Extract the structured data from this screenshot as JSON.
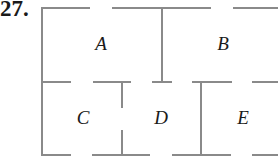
{
  "problem": {
    "number": "27."
  },
  "diagram": {
    "type": "floor-plan",
    "wall_color": "#8a8a8a",
    "label_color": "#1a1a1a",
    "rooms": [
      {
        "id": "A",
        "label": "A",
        "x": 101,
        "y": 46
      },
      {
        "id": "B",
        "label": "B",
        "x": 223,
        "y": 46
      },
      {
        "id": "C",
        "label": "C",
        "x": 83,
        "y": 120
      },
      {
        "id": "D",
        "label": "D",
        "x": 161,
        "y": 120
      },
      {
        "id": "E",
        "label": "E",
        "x": 243,
        "y": 120
      }
    ],
    "walls": [
      {
        "name": "top-wall-seg-1",
        "x1": 42,
        "y1": 8,
        "x2": 90,
        "y2": 8
      },
      {
        "name": "top-wall-seg-2",
        "x1": 112,
        "y1": 8,
        "x2": 211,
        "y2": 8
      },
      {
        "name": "top-wall-seg-3",
        "x1": 233,
        "y1": 8,
        "x2": 278,
        "y2": 8
      },
      {
        "name": "left-wall",
        "x1": 42,
        "y1": 7,
        "x2": 42,
        "y2": 156
      },
      {
        "name": "middle-wall-seg-1",
        "x1": 42,
        "y1": 82,
        "x2": 71,
        "y2": 82
      },
      {
        "name": "middle-wall-seg-2",
        "x1": 93,
        "y1": 82,
        "x2": 131,
        "y2": 82
      },
      {
        "name": "middle-wall-seg-3",
        "x1": 152,
        "y1": 82,
        "x2": 172,
        "y2": 82
      },
      {
        "name": "middle-wall-seg-4",
        "x1": 192,
        "y1": 82,
        "x2": 232,
        "y2": 82
      },
      {
        "name": "middle-wall-seg-5",
        "x1": 252,
        "y1": 82,
        "x2": 278,
        "y2": 82
      },
      {
        "name": "bottom-wall-seg-1",
        "x1": 42,
        "y1": 155,
        "x2": 71,
        "y2": 155
      },
      {
        "name": "bottom-wall-seg-2",
        "x1": 92,
        "y1": 155,
        "x2": 150,
        "y2": 155
      },
      {
        "name": "bottom-wall-seg-3",
        "x1": 172,
        "y1": 155,
        "x2": 231,
        "y2": 155
      },
      {
        "name": "bottom-wall-seg-4",
        "x1": 252,
        "y1": 155,
        "x2": 278,
        "y2": 155
      },
      {
        "name": "divider-a-b",
        "x1": 162,
        "y1": 8,
        "x2": 162,
        "y2": 82
      },
      {
        "name": "divider-c-d-upper",
        "x1": 122,
        "y1": 82,
        "x2": 122,
        "y2": 108
      },
      {
        "name": "divider-c-d-lower",
        "x1": 122,
        "y1": 130,
        "x2": 122,
        "y2": 155
      },
      {
        "name": "divider-d-e",
        "x1": 201,
        "y1": 82,
        "x2": 201,
        "y2": 155
      }
    ]
  }
}
